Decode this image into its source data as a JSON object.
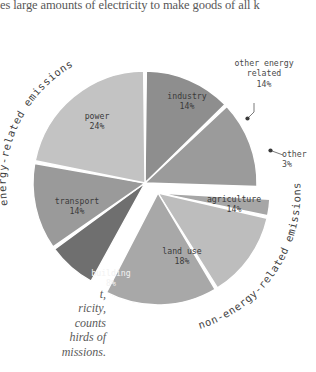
{
  "caption": {
    "top_text": "es large amounts of electricity to make goods of all k",
    "bottom_lines": [
      "t,",
      "ricity,",
      "counts",
      "hirds of",
      "missions."
    ]
  },
  "chart_data": {
    "type": "pie",
    "title": "",
    "categories": [
      "industry",
      "other energy related",
      "other",
      "agriculture",
      "land use",
      "building",
      "transport",
      "power"
    ],
    "values": [
      14,
      14,
      3,
      14,
      18,
      8,
      14,
      24
    ],
    "unit": "%",
    "groups": [
      {
        "name": "energy-related emissions",
        "members": [
          "industry",
          "other energy related",
          "building",
          "transport",
          "power"
        ],
        "total": 74
      },
      {
        "name": "non-energy-related emissions",
        "members": [
          "other",
          "agriculture",
          "land use"
        ],
        "total": 35
      }
    ],
    "legend": "none",
    "slices": [
      {
        "label": "industry",
        "value": 14,
        "value_text": "14%",
        "color": "#8e8e8e",
        "inside_label": true
      },
      {
        "label": "other energy related",
        "value": 14,
        "value_text": "14%",
        "color": "#9b9b9b",
        "inside_label": false
      },
      {
        "label": "other",
        "value": 3,
        "value_text": "3%",
        "color": "#a6a6a6",
        "inside_label": false
      },
      {
        "label": "agriculture",
        "value": 14,
        "value_text": "14%",
        "color": "#bdbdbd",
        "inside_label": true
      },
      {
        "label": "land use",
        "value": 18,
        "value_text": "18%",
        "color": "#a8a8a8",
        "inside_label": true
      },
      {
        "label": "building",
        "value": 8,
        "value_text": "8%",
        "color": "#6f6f6f",
        "inside_label": true
      },
      {
        "label": "transport",
        "value": 14,
        "value_text": "14%",
        "color": "#9a9a9a",
        "inside_label": true
      },
      {
        "label": "power",
        "value": 24,
        "value_text": "24%",
        "color": "#c3c3c3",
        "inside_label": true
      }
    ]
  },
  "labels": {
    "industry": {
      "name": "industry",
      "value": "14%"
    },
    "power": {
      "name": "power",
      "value": "24%"
    },
    "transport": {
      "name": "transport",
      "value": "14%"
    },
    "building": {
      "name": "building",
      "value": "8%"
    },
    "land_use": {
      "name": "land use",
      "value": "18%"
    },
    "agriculture": {
      "name": "agriculture",
      "value": "14%"
    }
  },
  "callouts": {
    "other_energy": {
      "line1": "other energy",
      "line2": "related",
      "value": "14%"
    },
    "other": {
      "line1": "other",
      "value": "3%"
    }
  },
  "arc_labels": {
    "energy": "energy-related emissions",
    "non_energy": "non-energy-related emissions"
  },
  "colors": {
    "background": "#ffffff",
    "text": "#3a3a3a",
    "caption": "#575757",
    "slice_dark": "#6f6f6f",
    "slice_light": "#c3c3c3"
  }
}
